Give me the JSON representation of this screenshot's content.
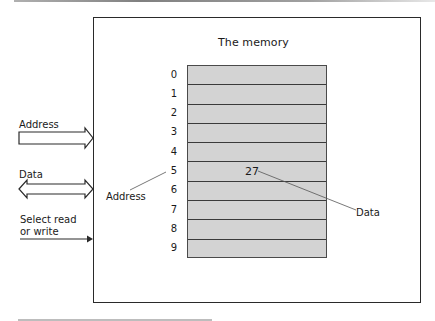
{
  "diagram": {
    "title": "The memory",
    "memory": {
      "addresses": [
        "0",
        "1",
        "2",
        "3",
        "4",
        "5",
        "6",
        "7",
        "8",
        "9"
      ],
      "highlighted_address": "5",
      "highlighted_value": "27"
    },
    "inputs": {
      "address_label": "Address",
      "data_label": "Data",
      "select_label_line1": "Select read",
      "select_label_line2": "or write"
    },
    "annotations": {
      "address_pointer_label": "Address",
      "data_pointer_label": "Data"
    },
    "colors": {
      "cell_fill": "#d3d3d3",
      "line": "#2a2a2a",
      "background": "#ffffff"
    }
  }
}
